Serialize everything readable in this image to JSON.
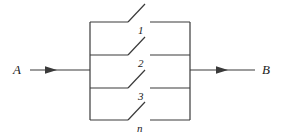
{
  "figure": {
    "type": "reliability-block-diagram",
    "colors": {
      "line": "#3a3a3a",
      "text": "#1a1a1a",
      "background": "#ffffff"
    },
    "stroke_width": 1.2
  },
  "terminals": {
    "input": {
      "label": "A",
      "x": 16,
      "y": 70,
      "lead_start_x": 30,
      "lead_end_x": 90,
      "arrow_tip_x": 57
    },
    "output": {
      "label": "B",
      "x": 262,
      "y": 70,
      "lead_start_x": 190,
      "lead_end_x": 255,
      "arrow_tip_x": 228
    }
  },
  "bus": {
    "left_x": 90,
    "right_x": 190,
    "top_y": 22,
    "bottom_y": 120
  },
  "branches": [
    {
      "label": "1",
      "rail_y": 22,
      "left_seg_end_x": 128,
      "right_seg_start_x": 150,
      "blade_tip_x": 145,
      "blade_tip_y": 4,
      "label_x": 138,
      "label_y": 30
    },
    {
      "label": "2",
      "rail_y": 55,
      "left_seg_end_x": 128,
      "right_seg_start_x": 150,
      "blade_tip_x": 145,
      "blade_tip_y": 37,
      "label_x": 138,
      "label_y": 63
    },
    {
      "label": "3",
      "rail_y": 88,
      "left_seg_end_x": 128,
      "right_seg_start_x": 150,
      "blade_tip_x": 145,
      "blade_tip_y": 70,
      "label_x": 138,
      "label_y": 96
    },
    {
      "label": "n",
      "rail_y": 120,
      "left_seg_end_x": 128,
      "right_seg_start_x": 150,
      "blade_tip_x": 145,
      "blade_tip_y": 102,
      "label_x": 137,
      "label_y": 128
    }
  ]
}
